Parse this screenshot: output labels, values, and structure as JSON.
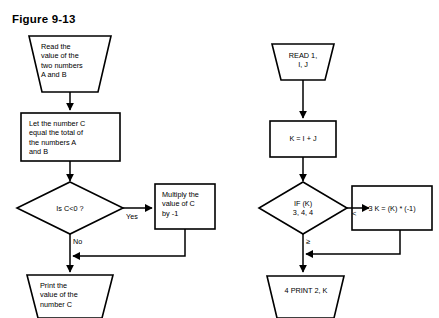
{
  "figure": {
    "title": "Figure 9-13"
  },
  "left_flowchart": {
    "name": "natural-language-flowchart",
    "nodes": [
      {
        "id": "read-ab",
        "type": "input-trapezoid",
        "text": "Read the\nvalue of the\ntwo numbers\nA and B"
      },
      {
        "id": "let-c",
        "type": "process-box",
        "text": "Let the number C\nequal the total of\nthe numbers A\nand B"
      },
      {
        "id": "is-c-neg",
        "type": "decision-diamond",
        "text": "Is C<0 ?"
      },
      {
        "id": "multiply-c",
        "type": "process-box",
        "text": "Multiply the\nvalue of C\nby -1"
      },
      {
        "id": "print-c",
        "type": "output-trapezoid",
        "text": "Print the\nvalue of the\nnumber C"
      }
    ],
    "edge_labels": {
      "yes": "Yes",
      "no": "No"
    }
  },
  "right_flowchart": {
    "name": "fortran-flowchart",
    "nodes": [
      {
        "id": "read-1",
        "type": "input-trapezoid",
        "text": "READ 1,\nI, J"
      },
      {
        "id": "k-sum",
        "type": "process-box",
        "text": "K = I + J"
      },
      {
        "id": "if-k",
        "type": "decision-diamond",
        "text": "IF (K)\n3, 4, 4"
      },
      {
        "id": "k-negate",
        "type": "process-box",
        "text": "3 K = (K) * (-1)"
      },
      {
        "id": "print-2",
        "type": "output-trapezoid",
        "text": "4 PRINT 2, K"
      }
    ],
    "edge_labels": {
      "less_than": "<",
      "greater_equal": "≥"
    }
  },
  "colors": {
    "stroke": "#000000",
    "background": "#ffffff",
    "text": "#000000"
  }
}
